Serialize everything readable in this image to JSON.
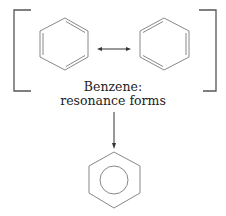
{
  "diagram": {
    "title_line1": "Benzene:",
    "title_line2": "resonance forms",
    "structures": [
      {
        "name": "kekule-structure-1",
        "type": "hexagon-alternating-double-bonds"
      },
      {
        "name": "kekule-structure-2",
        "type": "hexagon-alternating-double-bonds"
      },
      {
        "name": "resonance-hybrid",
        "type": "hexagon-with-inscribed-circle"
      }
    ],
    "arrows": [
      {
        "name": "resonance-arrow",
        "type": "double-headed"
      },
      {
        "name": "hybrid-arrow",
        "type": "single-headed-down"
      }
    ],
    "colors": {
      "line": "#888888",
      "bracket": "#555555",
      "arrow": "#333333",
      "text": "#222222"
    }
  }
}
